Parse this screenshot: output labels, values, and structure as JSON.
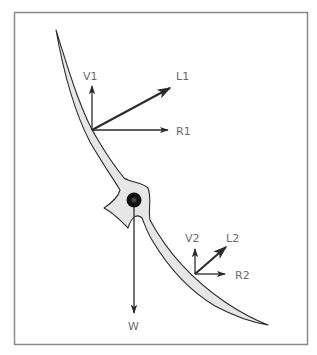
{
  "diagram": {
    "type": "force-diagram",
    "colors": {
      "frame": "#8a8a8a",
      "blade_fill": "#e6e6e6",
      "stroke": "#2a2a2a",
      "label": "#6b6b6b",
      "hub": "#111111"
    },
    "labels": {
      "v1": "V1",
      "l1": "L1",
      "r1": "R1",
      "v2": "V2",
      "l2": "L2",
      "r2": "R2",
      "w": "W"
    },
    "force_groups": [
      {
        "id": "upper",
        "vectors": [
          "V1",
          "L1",
          "R1"
        ]
      },
      {
        "id": "lower",
        "vectors": [
          "V2",
          "L2",
          "R2"
        ]
      },
      {
        "id": "weight",
        "vectors": [
          "W"
        ]
      }
    ]
  }
}
